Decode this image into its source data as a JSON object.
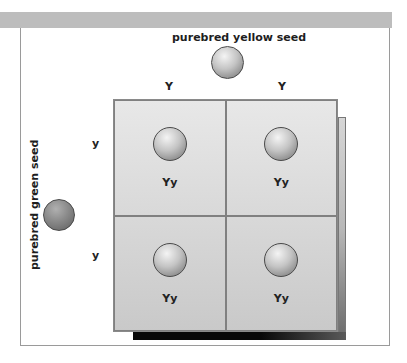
{
  "diagram": {
    "title_top": "purebred yellow seed",
    "title_left": "purebred green seed",
    "top_gametes": [
      "Y",
      "Y"
    ],
    "left_gametes": [
      "y",
      "y"
    ],
    "cells": [
      {
        "genotype": "Yy"
      },
      {
        "genotype": "Yy"
      },
      {
        "genotype": "Yy"
      },
      {
        "genotype": "Yy"
      }
    ],
    "colors": {
      "band": "#bdbdbd",
      "frame_border": "#9a9a9a",
      "grid_fill_top": "#e8e8e8",
      "grid_fill_bottom": "#c9c9c9"
    }
  }
}
